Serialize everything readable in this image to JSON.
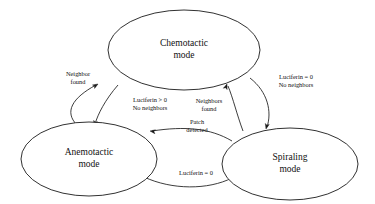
{
  "figure": {
    "type": "state-transition-diagram",
    "background_color": "#ffffff",
    "stroke_color": "#1a1a1a",
    "text_color": "#111111",
    "width": 375,
    "height": 204
  },
  "nodes": [
    {
      "id": "chemotactic",
      "line1": "Chemotactic",
      "line2": "mode",
      "cx": 184,
      "cy": 50,
      "rx": 76,
      "ry": 40
    },
    {
      "id": "anemotactic",
      "line1": "Anemotactic",
      "line2": "mode",
      "cx": 89,
      "cy": 159,
      "rx": 68,
      "ry": 37
    },
    {
      "id": "spiraling",
      "line1": "Spiraling",
      "line2": "mode",
      "cx": 290,
      "cy": 164,
      "rx": 68,
      "ry": 36
    }
  ],
  "edges": [
    {
      "id": "anemotactic-to-chemotactic",
      "from": "anemotactic",
      "to": "chemotactic",
      "line1": "Neighbor",
      "line2": "found",
      "label_x": 78,
      "label_y": 79,
      "path": "M 77 125 C 64 112 72 98 96 85",
      "arrow_x": 98,
      "arrow_y": 84,
      "arrow_angle": -31
    },
    {
      "id": "chemotactic-to-anemotactic",
      "from": "chemotactic",
      "to": "anemotactic",
      "line1": "Luciferin > 0",
      "line2": "No neighbors",
      "label_x": 150,
      "label_y": 105,
      "path": "M 118 85 C 105 100 98 114 95 124",
      "arrow_x": 94,
      "arrow_y": 126,
      "arrow_angle": 108
    },
    {
      "id": "spiraling-to-chemotactic",
      "from": "spiraling",
      "to": "chemotactic",
      "line1": "Neighbors",
      "line2": "found",
      "label_x": 209,
      "label_y": 106,
      "path": "M 243 131 C 237 115 233 98 228 86",
      "arrow_x": 227,
      "arrow_y": 84,
      "arrow_angle": -70
    },
    {
      "id": "chemotactic-to-spiraling",
      "from": "chemotactic",
      "to": "spiraling",
      "line1": "Luciferin = 0",
      "line2": "No neighbors",
      "label_x": 296,
      "label_y": 82,
      "path": "M 250 78 C 268 92 272 112 267 127",
      "arrow_x": 266,
      "arrow_y": 129,
      "arrow_angle": 104
    },
    {
      "id": "spiraling-to-anemotactic",
      "from": "spiraling",
      "to": "anemotactic",
      "line1": "Patch",
      "line2": "detected",
      "label_x": 197,
      "label_y": 127,
      "path": "M 232 141 C 210 128 185 126 152 131",
      "arrow_x": 150,
      "arrow_y": 131,
      "arrow_angle": 188
    },
    {
      "id": "anemotactic-to-spiraling",
      "from": "anemotactic",
      "to": "spiraling",
      "line1": "Luciferin = 0",
      "line2": "",
      "label_x": 196,
      "label_y": 174,
      "path": "M 144 177 C 172 190 208 190 232 178",
      "arrow_x": 234,
      "arrow_y": 177,
      "arrow_angle": -28
    }
  ]
}
